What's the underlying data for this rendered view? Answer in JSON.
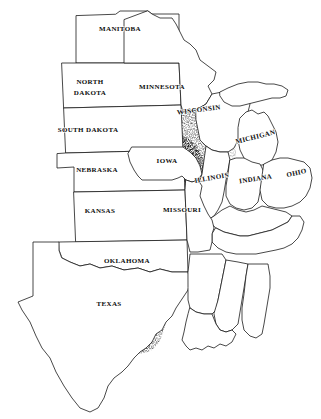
{
  "map": {
    "title": "Central United States and Manitoba outline map with stippled corridor",
    "background_color": "#ffffff",
    "outline_color": "#1a1a1a",
    "label_color": "#0d0d0d",
    "shading": {
      "name": "stippled-corridor",
      "description": "Diffuse gray stippled north-south band",
      "color": "#9a9a9a",
      "dark_color": "#6e6e6e",
      "light_color": "#cfcfcf"
    },
    "labels": [
      {
        "id": "manitoba",
        "text": "MANITOBA",
        "x": 120,
        "y": 31,
        "rotate": 0,
        "size": "lg"
      },
      {
        "id": "north-dakota-1",
        "text": "NORTH",
        "x": 90,
        "y": 84,
        "rotate": 0,
        "size": "lg"
      },
      {
        "id": "north-dakota-2",
        "text": "DAKOTA",
        "x": 90,
        "y": 95,
        "rotate": 0,
        "size": "lg"
      },
      {
        "id": "minnesota",
        "text": "MINNESOTA",
        "x": 162,
        "y": 89,
        "rotate": 0,
        "size": "lg"
      },
      {
        "id": "wisconsin",
        "text": "WISCONSIN",
        "x": 199,
        "y": 112,
        "rotate": -7,
        "size": "lg"
      },
      {
        "id": "south-dakota",
        "text": "SOUTH DAKOTA",
        "x": 88,
        "y": 132,
        "rotate": 0,
        "size": "lg"
      },
      {
        "id": "michigan",
        "text": "MICHIGAN",
        "x": 256,
        "y": 139,
        "rotate": -14,
        "size": "lg"
      },
      {
        "id": "iowa",
        "text": "IOWA",
        "x": 167,
        "y": 163,
        "rotate": 0,
        "size": "lg"
      },
      {
        "id": "nebraska",
        "text": "NEBRASKA",
        "x": 97,
        "y": 172,
        "rotate": 0,
        "size": "lg"
      },
      {
        "id": "illinois",
        "text": "ILLINOIS",
        "x": 212,
        "y": 180,
        "rotate": -10,
        "size": "lg"
      },
      {
        "id": "indiana",
        "text": "INDIANA",
        "x": 256,
        "y": 181,
        "rotate": -9,
        "size": "lg"
      },
      {
        "id": "ohio",
        "text": "OHIO",
        "x": 297,
        "y": 175,
        "rotate": -12,
        "size": "lg"
      },
      {
        "id": "kansas",
        "text": "KANSAS",
        "x": 100,
        "y": 213,
        "rotate": 0,
        "size": "lg"
      },
      {
        "id": "missouri",
        "text": "MISSOURI",
        "x": 182,
        "y": 212,
        "rotate": 0,
        "size": "lg"
      },
      {
        "id": "oklahoma",
        "text": "OKLAHOMA",
        "x": 127,
        "y": 263,
        "rotate": 0,
        "size": "lg"
      },
      {
        "id": "texas",
        "text": "TEXAS",
        "x": 109,
        "y": 306,
        "rotate": 0,
        "size": "lg"
      }
    ]
  }
}
